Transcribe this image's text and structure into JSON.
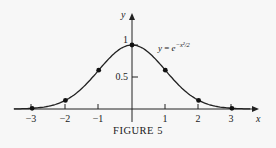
{
  "chart_data": {
    "type": "line",
    "title": "",
    "caption": "FIGURE 5",
    "xlabel": "x",
    "ylabel": "y",
    "annotation": "y = e^{-x^2/2}",
    "x_ticks": [
      -3,
      -2,
      -1,
      1,
      2,
      3
    ],
    "y_ticks": [
      0.5,
      1
    ],
    "xlim": [
      -3.5,
      3.6
    ],
    "ylim": [
      0,
      1.3
    ],
    "grid": false,
    "legend": null,
    "series": [
      {
        "name": "y = e^{-x^2/2}",
        "function": "exp(-x^2/2)",
        "marked_points": {
          "x": [
            -3,
            -2,
            -1,
            0,
            1,
            2,
            3
          ],
          "y": [
            0.011,
            0.135,
            0.607,
            1.0,
            0.607,
            0.135,
            0.011
          ]
        }
      }
    ]
  },
  "labels": {
    "x_axis": "x",
    "y_axis": "y",
    "tick_neg3": "−3",
    "tick_neg2": "−2",
    "tick_neg1": "−1",
    "tick_1": "1",
    "tick_2": "2",
    "tick_3": "3",
    "tick_y_half": "0.5",
    "tick_y_one": "1",
    "eq_y": "y",
    "eq_eq": " = ",
    "eq_e": "e",
    "eq_exp": "−x²/2",
    "caption": "FIGURE 5"
  }
}
